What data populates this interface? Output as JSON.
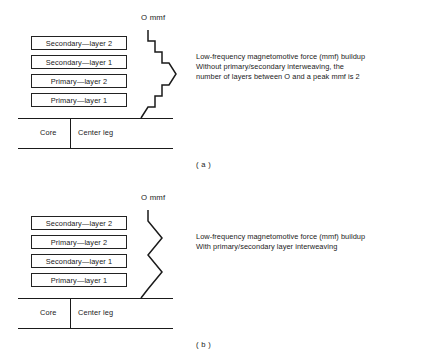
{
  "figures": [
    {
      "id": "a",
      "caption": "( a )",
      "mmf_axis_label": "O mmf",
      "layers": [
        "Secondary—layer 2",
        "Secondary—layer 1",
        "Primary—layer 2",
        "Primary—layer 1"
      ],
      "core": {
        "left_label": "Core",
        "right_label": "Center leg"
      },
      "description": [
        "Low-frequency magnetomotive force (mmf) buildup",
        "Without primary/secondary interweaving, the",
        "number of layers between O and a peak mmf is 2"
      ],
      "mmf_curve_points": "148,30 148,41 155,41 155,52 162,52 162,63 169,63 176,74 169,85 162,85 162,96 155,96 155,107 148,107 141,118"
    },
    {
      "id": "b",
      "caption": "( b )",
      "mmf_axis_label": "O mmf",
      "layers": [
        "Secondary—layer 2",
        "Primary—layer 2",
        "Secondary—layer 1",
        "Primary—layer 1"
      ],
      "core": {
        "left_label": "Core",
        "right_label": "Center leg"
      },
      "description": [
        "Low-frequency magnetomotive force (mmf) buildup",
        "With primary/secondary layer interweaving"
      ],
      "mmf_curve_points": "148,30 148,41 162,58 148,75 162,92 148,109 141,118"
    }
  ],
  "colors": {
    "ink": "#1a1a1a",
    "background": "#ffffff",
    "box_border": "#222222"
  }
}
